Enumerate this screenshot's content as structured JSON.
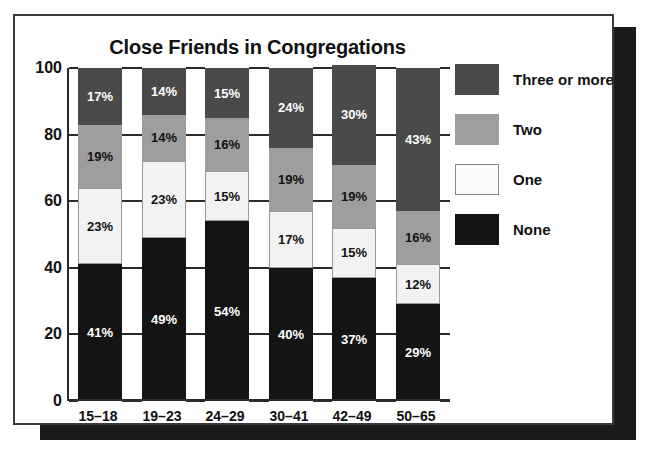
{
  "chart_data": {
    "type": "bar",
    "subtype": "stacked-percent-column",
    "title": "Close Friends in Congregations",
    "xlabel": "",
    "ylabel": "",
    "ylim": [
      0,
      100
    ],
    "yticks": [
      0,
      20,
      40,
      60,
      80,
      100
    ],
    "ytick_labels": [
      "0",
      "20",
      "40",
      "60",
      "80",
      "100"
    ],
    "grid": false,
    "legend_position": "right",
    "value_suffix": "%",
    "categories": [
      "15–18",
      "19–23",
      "24–29",
      "30–41",
      "42–49",
      "50–65"
    ],
    "series": [
      {
        "name": "None",
        "color": "#141414",
        "values": [
          41,
          49,
          54,
          40,
          37,
          29
        ],
        "labels": [
          "41%",
          "49%",
          "54%",
          "40%",
          "37%",
          "29%"
        ]
      },
      {
        "name": "One",
        "color": "#f2f2f2",
        "values": [
          23,
          23,
          15,
          17,
          15,
          12
        ],
        "labels": [
          "23%",
          "23%",
          "15%",
          "17%",
          "15%",
          "12%"
        ]
      },
      {
        "name": "Two",
        "color": "#9e9e9e",
        "values": [
          19,
          14,
          16,
          19,
          19,
          16
        ],
        "labels": [
          "19%",
          "14%",
          "16%",
          "19%",
          "19%",
          "16%"
        ]
      },
      {
        "name": "Three or more",
        "color": "#4a4a4a",
        "values": [
          17,
          14,
          15,
          24,
          30,
          43
        ],
        "labels": [
          "17%",
          "14%",
          "15%",
          "24%",
          "30%",
          "43%"
        ]
      }
    ]
  },
  "legend": {
    "items": [
      {
        "label": "Three or more",
        "key": "three"
      },
      {
        "label": "Two",
        "key": "two"
      },
      {
        "label": "One",
        "key": "one"
      },
      {
        "label": "None",
        "key": "none"
      }
    ]
  }
}
